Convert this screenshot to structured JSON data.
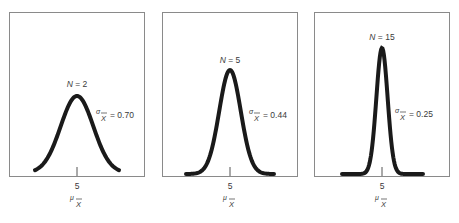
{
  "figure": {
    "panels": [
      {
        "n_label": "N = 2",
        "n_italic": "N",
        "n_rest": " = 2",
        "sigma_symbol": "σ",
        "sigma_sub": "X",
        "sigma_value": "= 0.70",
        "tick_label": "5",
        "mu_symbol": "μ",
        "mu_sub": "X"
      },
      {
        "n_label": "N = 5",
        "n_italic": "N",
        "n_rest": " = 5",
        "sigma_symbol": "σ",
        "sigma_sub": "X",
        "sigma_value": "= 0.44",
        "tick_label": "5",
        "mu_symbol": "μ",
        "mu_sub": "X"
      },
      {
        "n_label": "N = 15",
        "n_italic": "N",
        "n_rest": " = 15",
        "sigma_symbol": "σ",
        "sigma_sub": "X",
        "sigma_value": "= 0.25",
        "tick_label": "5",
        "mu_symbol": "μ",
        "mu_sub": "X"
      }
    ],
    "colors": {
      "curve": "#1a1a1a",
      "frame": "#8a8a8a",
      "text": "#3a3a3a"
    }
  },
  "chart_data": [
    {
      "type": "line",
      "title": "",
      "annotation_n": "N = 2",
      "annotation_sigma": "σ_X̄ = 0.70",
      "distribution": "normal",
      "mean": 5,
      "sd": 0.7,
      "xlabel": "μ_X̄",
      "x_ticks": [
        "5"
      ],
      "ylabel": "",
      "grid": false
    },
    {
      "type": "line",
      "title": "",
      "annotation_n": "N = 5",
      "annotation_sigma": "σ_X̄ = 0.44",
      "distribution": "normal",
      "mean": 5,
      "sd": 0.44,
      "xlabel": "μ_X̄",
      "x_ticks": [
        "5"
      ],
      "ylabel": "",
      "grid": false
    },
    {
      "type": "line",
      "title": "",
      "annotation_n": "N = 15",
      "annotation_sigma": "σ_X̄ = 0.25",
      "distribution": "normal",
      "mean": 5,
      "sd": 0.25,
      "xlabel": "μ_X̄",
      "x_ticks": [
        "5"
      ],
      "ylabel": "",
      "grid": false
    }
  ]
}
